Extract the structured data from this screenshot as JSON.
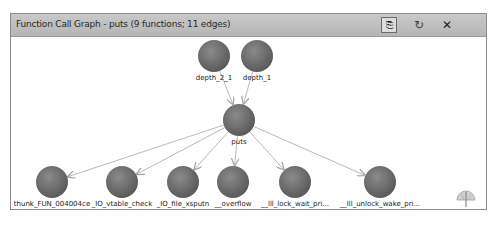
{
  "window": {
    "title": "Function Call Graph - puts (9 functions; 11 edges)",
    "buttons": {
      "export": "⎘",
      "refresh": "↻",
      "close": "✕"
    }
  },
  "graph": {
    "node_color": "#6e6e6e",
    "edge_color": "#b8b8b8",
    "nodes": [
      {
        "id": "depth_2_1",
        "label": "depth_2_1",
        "x": 214,
        "y": 56
      },
      {
        "id": "depth_1",
        "label": "depth_1",
        "x": 257,
        "y": 56
      },
      {
        "id": "puts",
        "label": "puts",
        "x": 239,
        "y": 120
      },
      {
        "id": "thunk_FUN_004004ce",
        "label": "thunk_FUN_004004ce",
        "x": 52,
        "y": 182
      },
      {
        "id": "_IO_vtable_check",
        "label": "_IO_vtable_check",
        "x": 122,
        "y": 182
      },
      {
        "id": "_IO_file_xsputn",
        "label": "_IO_file_xsputn",
        "x": 183,
        "y": 182
      },
      {
        "id": "__overflow",
        "label": "__overflow",
        "x": 233,
        "y": 182
      },
      {
        "id": "__lll_lock_wait_pri",
        "label": "__lll_lock_wait_pri...",
        "x": 295,
        "y": 182
      },
      {
        "id": "__lll_unlock_wake_pri",
        "label": "__lll_unlock_wake_pri...",
        "x": 380,
        "y": 182
      }
    ],
    "edges": [
      [
        "depth_2_1",
        "puts"
      ],
      [
        "depth_1",
        "puts"
      ],
      [
        "puts",
        "thunk_FUN_004004ce"
      ],
      [
        "puts",
        "_IO_vtable_check"
      ],
      [
        "puts",
        "_IO_file_xsputn"
      ],
      [
        "puts",
        "__overflow"
      ],
      [
        "puts",
        "__lll_lock_wait_pri"
      ],
      [
        "puts",
        "__lll_unlock_wake_pri"
      ]
    ]
  },
  "satellite": {
    "icon": "satellite-view-icon"
  }
}
